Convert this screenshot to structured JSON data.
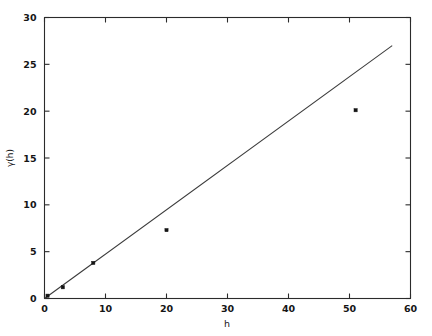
{
  "figure": {
    "background_color": "#ffffff",
    "ink_color": "#1a1a1a",
    "width": 432,
    "height": 336
  },
  "chart_data": {
    "type": "scatter",
    "title": "",
    "subtitle": "",
    "xlabel": "h",
    "ylabel": "γ(h)",
    "xlim": [
      0,
      60
    ],
    "ylim": [
      0,
      30
    ],
    "xticks": [
      0,
      10,
      20,
      30,
      40,
      50,
      60
    ],
    "yticks": [
      0,
      5,
      10,
      15,
      20,
      25,
      30
    ],
    "xticklabels": [
      "0",
      "10",
      "20",
      "30",
      "40",
      "50",
      "60"
    ],
    "yticklabels": [
      "0",
      "5",
      "10",
      "15",
      "20",
      "25",
      "30"
    ],
    "grid": false,
    "legend": null,
    "tick_direction": "in",
    "box_frame": true,
    "series": [
      {
        "name": "experimental semivariogram",
        "type": "scatter",
        "marker": "square",
        "marker_size": 3.2,
        "color": "#141414",
        "points": [
          {
            "x": 0.5,
            "y": 0.3
          },
          {
            "x": 3.0,
            "y": 1.2
          },
          {
            "x": 8.0,
            "y": 3.8
          },
          {
            "x": 20.0,
            "y": 7.3
          },
          {
            "x": 51.0,
            "y": 20.1
          }
        ]
      },
      {
        "name": "fitted model",
        "type": "line",
        "color": "#3a3a3a",
        "linewidth": 1.05,
        "points": [
          {
            "x": 0.0,
            "y": 0.0
          },
          {
            "x": 57.0,
            "y": 27.0
          }
        ]
      }
    ],
    "annotations": []
  },
  "axes": {
    "x_axis_name": "h-axis",
    "y_axis_name": "gamma-h-axis"
  }
}
